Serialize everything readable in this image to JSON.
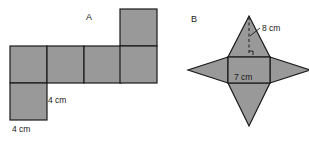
{
  "diagram": {
    "background_color": "#ffffff",
    "shape_fill": "#999999",
    "shape_stroke": "#1a1a1a",
    "text_color": "#1a1a1a"
  },
  "figures": [
    {
      "id": "A",
      "label": "A",
      "name": "net-of-cube",
      "description": "Net made of six shaded squares: a horizontal row of four squares, one square above the rightmost, one square below the leftmost",
      "square_size_px": 37,
      "dimensions": [
        {
          "name": "side-vertical",
          "value": "4 cm"
        },
        {
          "name": "side-horizontal",
          "value": "4 cm"
        }
      ],
      "squares": [
        {
          "col": 0,
          "row": 1
        },
        {
          "col": 1,
          "row": 1
        },
        {
          "col": 2,
          "row": 1
        },
        {
          "col": 3,
          "row": 1
        },
        {
          "col": 3,
          "row": 0
        },
        {
          "col": 0,
          "row": 2
        }
      ]
    },
    {
      "id": "B",
      "label": "B",
      "name": "net-of-square-pyramid",
      "description": "Net of a square pyramid: central square with four shaded triangles attached to each side, forming a star",
      "dimensions": [
        {
          "name": "slant-height",
          "value": "8 cm"
        },
        {
          "name": "base-edge",
          "value": "7 cm"
        }
      ],
      "annotations": {
        "dashed_height_line": true,
        "leader_line": true
      }
    }
  ]
}
